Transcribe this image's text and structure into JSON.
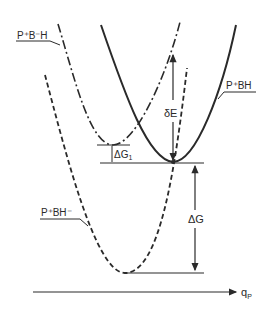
{
  "diagram": {
    "type": "potential-energy-surfaces",
    "curves": [
      {
        "id": "pbh",
        "label": "P⁺BH",
        "style": "solid"
      },
      {
        "id": "pbmh",
        "label": "P⁺B⁻H",
        "style": "dash-dot"
      },
      {
        "id": "pbhm",
        "label": "P⁺BH⁻",
        "style": "dashed"
      }
    ],
    "annotations": {
      "delta_e": "δE",
      "delta_g1": "ΔG",
      "delta_g1_sub": "1",
      "delta_g": "ΔG"
    },
    "axis": {
      "label": "q",
      "label_sub": "P"
    },
    "colors": {
      "ink": "#2a2a2a",
      "background": "#ffffff"
    }
  }
}
